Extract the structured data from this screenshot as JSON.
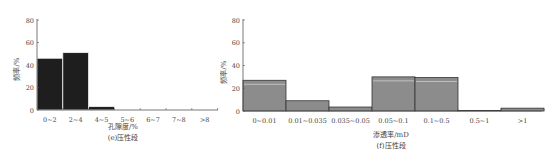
{
  "chart_data": [
    {
      "type": "bar",
      "title": "",
      "caption": "(e)压性段",
      "xlabel": "孔隙度/%",
      "ylabel": "频率/%",
      "ylim": [
        0,
        80
      ],
      "yticks": [
        0,
        20,
        40,
        60,
        80
      ],
      "grid": false,
      "legend": null,
      "bar_color": "#1e1e1e",
      "categories": [
        "0~2",
        "2~4",
        "4~5",
        "5~6",
        "6~7",
        "7~8",
        ">8"
      ],
      "values": [
        46,
        51,
        3,
        0,
        0,
        0,
        0
      ]
    },
    {
      "type": "bar",
      "title": "",
      "caption": "(f)压性段",
      "xlabel": "渗透率/mD",
      "ylabel": "频率/%",
      "ylim": [
        0,
        80
      ],
      "yticks": [
        0,
        20,
        40,
        60,
        80
      ],
      "grid": false,
      "legend": null,
      "bar_color": "#8c8c8c",
      "categories": [
        "0~0.01",
        "0.01~0.035",
        "0.035~0.05",
        "0.05~0.1",
        "0.1~0.5",
        "0.5~1",
        ">1"
      ],
      "values": [
        27,
        9,
        3.5,
        30,
        29.5,
        0.5,
        2.5
      ]
    }
  ]
}
